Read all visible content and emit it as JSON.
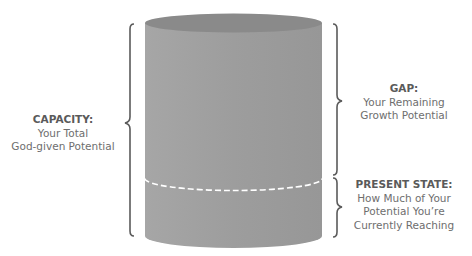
{
  "diagram": {
    "type": "cylinder-capacity-diagram",
    "colors": {
      "cylinder_body": "#9e9e9e",
      "cylinder_top": "#8a8a8a",
      "bracket": "#5b5b5b",
      "dashed_line": "#ffffff",
      "text": "#6e6e6e",
      "title_text": "#5a5a5a"
    },
    "fill_level_fraction": 0.27,
    "labels": {
      "capacity": {
        "title": "CAPACITY:",
        "lines": [
          "Your Total",
          "God-given Potential"
        ]
      },
      "gap": {
        "title": "GAP:",
        "lines": [
          "Your Remaining",
          "Growth Potential"
        ]
      },
      "present_state": {
        "title": "PRESENT STATE:",
        "lines": [
          "How Much of Your",
          "Potential You’re",
          "Currently Reaching"
        ]
      }
    }
  }
}
